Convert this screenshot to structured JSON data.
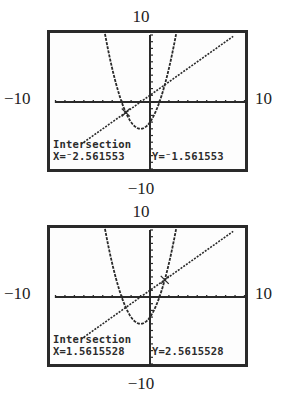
{
  "figure": {
    "panels": [
      {
        "window": {
          "ymax_label": "10",
          "ymin_label": "−10",
          "xmin_label": "−10",
          "xmax_label": "10"
        },
        "readout": {
          "title": "Intersection",
          "x_text": "X=⁻2.561553",
          "y_text": "Y=⁻1.561553"
        }
      },
      {
        "window": {
          "ymax_label": "10",
          "ymin_label": "−10",
          "xmin_label": "−10",
          "xmax_label": "10"
        },
        "readout": {
          "title": "Intersection",
          "x_text": "X=1.5615528",
          "y_text": "Y=2.5615528"
        }
      }
    ]
  },
  "chart_data": [
    {
      "type": "line",
      "title": "Graphing calculator screen: Intersection",
      "xlabel": "",
      "ylabel": "",
      "xlim": [
        -10,
        10
      ],
      "ylim": [
        -10,
        10
      ],
      "xscale": 1,
      "yscale": 1,
      "grid": false,
      "series": [
        {
          "name": "y = x^2 + 2x - 3",
          "style": "dashed",
          "x": [
            -5.2,
            -4,
            -3,
            -2,
            -1,
            0,
            1,
            2,
            3.2
          ],
          "y": [
            9.64,
            5,
            0,
            -3,
            -4,
            -3,
            0,
            5,
            13.64
          ]
        },
        {
          "name": "y = x + 1",
          "style": "dotted",
          "x": [
            -7.3,
            8.8
          ],
          "y": [
            -6.3,
            9.8
          ]
        }
      ],
      "annotations": [
        {
          "text": "Intersection",
          "x": -2.561553,
          "y": -1.561553
        }
      ],
      "tick_labels": {
        "top": "10",
        "bottom": "-10",
        "left": "-10",
        "right": "10"
      }
    },
    {
      "type": "line",
      "title": "Graphing calculator screen: Intersection",
      "xlabel": "",
      "ylabel": "",
      "xlim": [
        -10,
        10
      ],
      "ylim": [
        -10,
        10
      ],
      "xscale": 1,
      "yscale": 1,
      "grid": false,
      "series": [
        {
          "name": "y = x^2 + 2x - 3",
          "style": "dashed",
          "x": [
            -5.2,
            -4,
            -3,
            -2,
            -1,
            0,
            1,
            2,
            3.2
          ],
          "y": [
            9.64,
            5,
            0,
            -3,
            -4,
            -3,
            0,
            5,
            13.64
          ]
        },
        {
          "name": "y = x + 1",
          "style": "dotted",
          "x": [
            -7.3,
            8.8
          ],
          "y": [
            -6.3,
            9.8
          ]
        }
      ],
      "annotations": [
        {
          "text": "Intersection",
          "x": 1.5615528,
          "y": 2.5615528
        }
      ],
      "tick_labels": {
        "top": "10",
        "bottom": "-10",
        "left": "-10",
        "right": "10"
      }
    }
  ]
}
